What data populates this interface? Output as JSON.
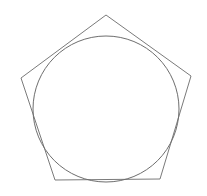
{
  "diagram": {
    "pentagon": {
      "points": "106,15 191,76 160,179 55,180 21,78",
      "stroke": "#7a7a7a"
    },
    "circle": {
      "cx": 106,
      "cy": 109,
      "r": 73,
      "stroke": "#6e6e6e"
    }
  }
}
